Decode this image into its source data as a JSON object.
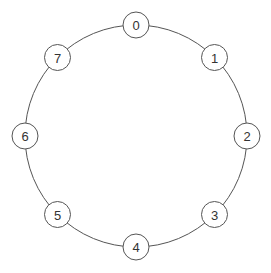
{
  "diagram": {
    "type": "ring",
    "nodes": [
      {
        "id": 0,
        "label": "0"
      },
      {
        "id": 1,
        "label": "1"
      },
      {
        "id": 2,
        "label": "2"
      },
      {
        "id": 3,
        "label": "3"
      },
      {
        "id": 4,
        "label": "4"
      },
      {
        "id": 5,
        "label": "5"
      },
      {
        "id": 6,
        "label": "6"
      },
      {
        "id": 7,
        "label": "7"
      }
    ],
    "edges": "ring connecting nodes 0-1-2-3-4-5-6-7-0 in order",
    "colors": {
      "stroke": "#555555",
      "node_fill": "#ffffff",
      "text": "#333333"
    }
  }
}
